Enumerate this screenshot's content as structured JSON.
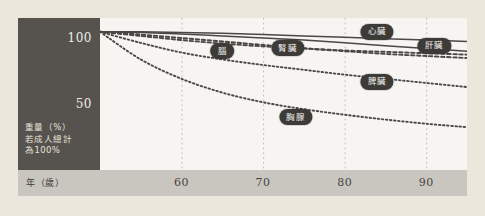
{
  "figure": {
    "background_color": "#ebe7dc",
    "panel_color": "#56534e",
    "plot_color": "#f6f5f1",
    "axis_strip_color": "#c9c6bf",
    "curve_color": "#4a4844",
    "badge_color": "#3d3b37"
  },
  "axes": {
    "y_caption_line1": "重量（%）",
    "y_caption_line2": "若成人總計",
    "y_caption_line3": "為100%",
    "x_caption": "年（歲）",
    "y_ticks": [
      "100",
      "50"
    ],
    "x_ticks": [
      "60",
      "70",
      "80",
      "90"
    ]
  },
  "chart_data": {
    "type": "line",
    "title": "",
    "subtitle": "",
    "xlabel": "年（歲）",
    "ylabel": "重量（%）若成人總計為100%",
    "xlim": [
      50,
      95
    ],
    "ylim": [
      0,
      110
    ],
    "grid": "vertical-dotted",
    "legend": "inline-badges",
    "y_ticks": [
      100,
      50
    ],
    "x_ticks": [
      60,
      70,
      80,
      90
    ],
    "x": [
      50,
      55,
      60,
      65,
      70,
      75,
      80,
      85,
      90,
      95
    ],
    "series": [
      {
        "name": "心臟",
        "label": "心臟",
        "style": "solid",
        "label_x": 84,
        "label_y": 100,
        "values": [
          100,
          100,
          99.5,
          99,
          98,
          97,
          96,
          95,
          94,
          93
        ]
      },
      {
        "name": "肝臟",
        "label": "肝臟",
        "style": "solid",
        "label_x": 91,
        "label_y": 90,
        "values": [
          100,
          99.5,
          98.5,
          97,
          95.5,
          94,
          92,
          90,
          88,
          86
        ]
      },
      {
        "name": "腎臟",
        "label": "腎臟",
        "style": "dashed",
        "label_x": 73,
        "label_y": 88,
        "values": [
          100,
          98,
          95.5,
          93,
          90.5,
          88,
          86,
          84,
          82.5,
          81
        ]
      },
      {
        "name": "腦",
        "label": "腦",
        "style": "dashed",
        "label_x": 65,
        "label_y": 86,
        "values": [
          100,
          97,
          94,
          91.5,
          89.5,
          88,
          86.5,
          85.5,
          84.5,
          83.5
        ]
      },
      {
        "name": "脾臟",
        "label": "脾臟",
        "style": "dotted",
        "label_x": 84,
        "label_y": 64,
        "values": [
          100,
          92,
          85,
          80,
          76,
          72.5,
          69,
          66,
          63,
          60
        ]
      },
      {
        "name": "胸腺",
        "label": "胸腺",
        "style": "dotted",
        "label_x": 74,
        "label_y": 38,
        "values": [
          100,
          80,
          66,
          56,
          49,
          44,
          40,
          36.5,
          33.5,
          31
        ]
      }
    ]
  }
}
